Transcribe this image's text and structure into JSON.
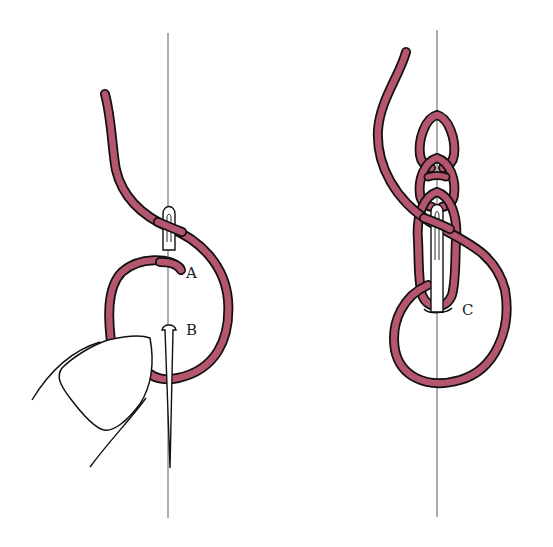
{
  "figure": {
    "colors": {
      "background": "#ffffff",
      "thread_fill": "#b5566f",
      "thread_outline": "#111111",
      "guide_line": "#8a8a8a",
      "needle_fill": "#ffffff",
      "needle_outline": "#111111"
    },
    "panels": [
      {
        "id": "left",
        "description": "Thread emerges at A, needle held by thumb re-enters at A and exits at B with the loop under the needle point",
        "labels": {
          "a": "A",
          "b": "B"
        }
      },
      {
        "id": "right",
        "description": "Several chain loops completed; needle passes through the last loop and emerges at C",
        "labels": {
          "c": "C"
        }
      }
    ]
  }
}
